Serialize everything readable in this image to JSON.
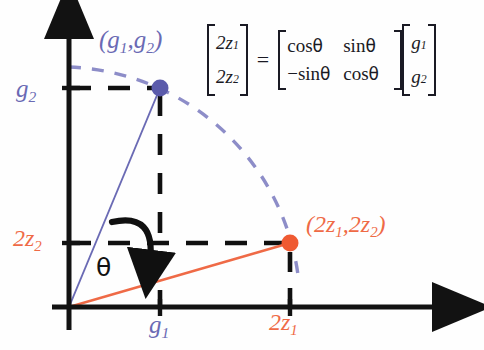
{
  "figure": {
    "type": "vector-rotation-diagram"
  },
  "colors": {
    "blue": "#6a6ab4",
    "blue_dot": "#5b5bab",
    "orange": "#ef6a46",
    "orange_dot": "#ef5a32",
    "axis": "#121212",
    "arc": "#8d8dc8",
    "dash": "#101010"
  },
  "axes": {
    "origin_label": "",
    "x_axis_name": "x-axis",
    "y_axis_name": "y-axis",
    "x_ticks": [
      {
        "label": "g",
        "sub": "1",
        "color": "#6a6ab4"
      },
      {
        "label": "2z",
        "sub": "1",
        "color": "#ef6a46"
      }
    ],
    "y_ticks": [
      {
        "label": "g",
        "sub": "2",
        "color": "#6a6ab4"
      },
      {
        "label": "2z",
        "sub": "2",
        "color": "#ef6a46"
      }
    ]
  },
  "labels": {
    "g2": {
      "base": "g",
      "sub": "2"
    },
    "two_z2": {
      "base": "2z",
      "sub": "2"
    },
    "g1": {
      "base": "g",
      "sub": "1"
    },
    "two_z1": {
      "base": "2z",
      "sub": "1"
    },
    "theta": "θ",
    "point_g": {
      "open": "(",
      "x_base": "g",
      "x_sub": "1",
      "comma": ",",
      "y_base": "g",
      "y_sub": "2",
      "close": ")"
    },
    "point_z": {
      "open": "(",
      "x_base": "2z",
      "x_sub": "1",
      "comma": ",",
      "y_base": "2z",
      "y_sub": "2",
      "close": ")"
    }
  },
  "equation": {
    "lhs": {
      "row1_base": "2z",
      "row1_sub": "1",
      "row2_base": "2z",
      "row2_sub": "2"
    },
    "equals": "=",
    "matrix": {
      "r1c1": "cos",
      "r1c1_sym": "θ",
      "r1c2": "sin",
      "r1c2_sym": "θ",
      "r2c1": "−sin",
      "r2c1_sym": "θ",
      "r2c2": "cos",
      "r2c2_sym": "θ"
    },
    "rhs": {
      "row1_base": "g",
      "row1_sub": "1",
      "row2_base": "g",
      "row2_sub": "2"
    }
  },
  "points": [
    {
      "name": "point-g",
      "cx": 160,
      "cy": 88,
      "r": 8,
      "color": "#5b5bab"
    },
    {
      "name": "point-2z",
      "cx": 290,
      "cy": 243,
      "r": 8,
      "color": "#ef5a32"
    }
  ],
  "arc": {
    "description": "dashed circular arc centered at origin through both points",
    "radius": 240,
    "color": "#8d8dc8"
  },
  "rotation_arrow": {
    "description": "curved clockwise arrow indicating rotation by theta",
    "color": "#101010"
  }
}
